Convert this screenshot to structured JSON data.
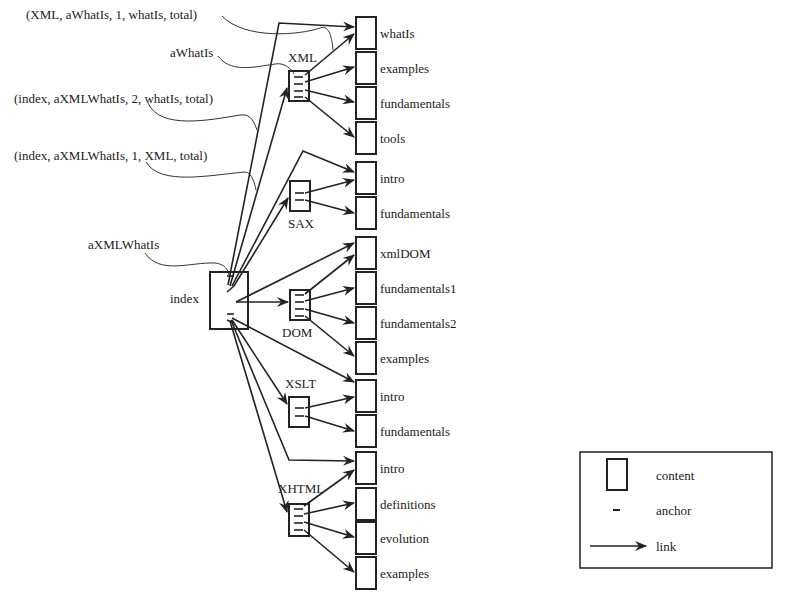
{
  "diagram": {
    "root": {
      "label": "index",
      "anchor_label": "aXMLWhatIs"
    },
    "annotations": [
      {
        "text": "(XML, aWhatIs, 1, whatIs, total)"
      },
      {
        "text": "aWhatIs"
      },
      {
        "text": "(index, aXMLWhatIs, 2, whatIs, total)"
      },
      {
        "text": "(index, aXMLWhatIs, 1, XML, total)"
      },
      {
        "text": "aXMLWhatIs"
      }
    ],
    "groups": [
      {
        "label": "XML",
        "children": [
          "whatIs",
          "examples",
          "fundamentals",
          "tools"
        ]
      },
      {
        "label": "SAX",
        "children": [
          "intro",
          "fundamentals"
        ]
      },
      {
        "label": "DOM",
        "children": [
          "xmlDOM",
          "fundamentals1",
          "fundamentals2",
          "examples"
        ]
      },
      {
        "label": "XSLT",
        "children": [
          "intro",
          "fundamentals"
        ]
      },
      {
        "label": "XHTML",
        "children": [
          "intro",
          "definitions",
          "evolution",
          "examples"
        ]
      }
    ],
    "pages": [
      "whatIs",
      "examples",
      "fundamentals",
      "tools",
      "intro",
      "fundamentals",
      "xmlDOM",
      "fundamentals1",
      "fundamentals2",
      "examples",
      "intro",
      "fundamentals",
      "intro",
      "definitions",
      "evolution",
      "examples"
    ],
    "legend": {
      "content": "content",
      "anchor": "anchor",
      "link": "link"
    }
  }
}
